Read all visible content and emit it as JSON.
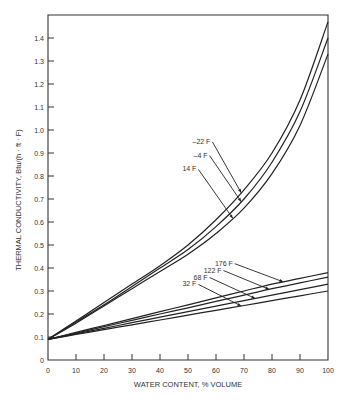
{
  "chart_data": {
    "type": "line",
    "title": "",
    "xlabel": "WATER CONTENT, % VOLUME",
    "ylabel": "THERMAL CONDUCTIVITY, Btu/(h · ft · F)",
    "xlim": [
      0,
      100
    ],
    "ylim": [
      0,
      1.5
    ],
    "xticks": [
      0,
      10,
      20,
      30,
      40,
      50,
      60,
      70,
      80,
      90,
      100
    ],
    "yticks": [
      0,
      0.1,
      0.2,
      0.3,
      0.4,
      0.5,
      0.6,
      0.7,
      0.8,
      0.9,
      1.0,
      1.1,
      1.2,
      1.3,
      1.4
    ],
    "ytick_labels": [
      "0",
      "0.1",
      "0.2",
      "0.3",
      "0.4",
      "0.5",
      "0.6",
      "0.7",
      "0.8",
      "0.9",
      "1.0",
      "1.1",
      "1.2",
      "1.3",
      "1.4"
    ],
    "grid": false,
    "legend": "inline labels with arrows",
    "x": [
      0,
      10,
      20,
      30,
      40,
      50,
      60,
      70,
      80,
      90,
      100
    ],
    "series": [
      {
        "name": "-22 F",
        "values": [
          0.09,
          0.17,
          0.25,
          0.33,
          0.41,
          0.5,
          0.61,
          0.74,
          0.9,
          1.13,
          1.47
        ]
      },
      {
        "name": "-4 F",
        "values": [
          0.09,
          0.165,
          0.24,
          0.32,
          0.4,
          0.48,
          0.58,
          0.7,
          0.86,
          1.08,
          1.4
        ]
      },
      {
        "name": "14 F",
        "values": [
          0.09,
          0.16,
          0.235,
          0.31,
          0.385,
          0.46,
          0.55,
          0.66,
          0.81,
          1.02,
          1.33
        ]
      },
      {
        "name": "176 F",
        "values": [
          0.09,
          0.12,
          0.15,
          0.18,
          0.21,
          0.24,
          0.27,
          0.3,
          0.33,
          0.355,
          0.38
        ]
      },
      {
        "name": "122 F",
        "values": [
          0.09,
          0.117,
          0.145,
          0.172,
          0.2,
          0.227,
          0.255,
          0.282,
          0.31,
          0.335,
          0.36
        ]
      },
      {
        "name": "68 F",
        "values": [
          0.09,
          0.114,
          0.138,
          0.162,
          0.186,
          0.21,
          0.234,
          0.258,
          0.282,
          0.306,
          0.33
        ]
      },
      {
        "name": "32 F",
        "values": [
          0.09,
          0.111,
          0.132,
          0.153,
          0.174,
          0.195,
          0.216,
          0.237,
          0.258,
          0.279,
          0.3
        ]
      }
    ],
    "annotations": [
      {
        "text": "-22 F",
        "x": 58,
        "y": 0.94
      },
      {
        "text": "-4 F",
        "x": 57,
        "y": 0.88
      },
      {
        "text": "14 F",
        "x": 53,
        "y": 0.82
      },
      {
        "text": "176 F",
        "x": 66,
        "y": 0.41
      },
      {
        "text": "122 F",
        "x": 62,
        "y": 0.38
      },
      {
        "text": "68 F",
        "x": 57,
        "y": 0.35
      },
      {
        "text": "32 F",
        "x": 53,
        "y": 0.32
      }
    ]
  }
}
